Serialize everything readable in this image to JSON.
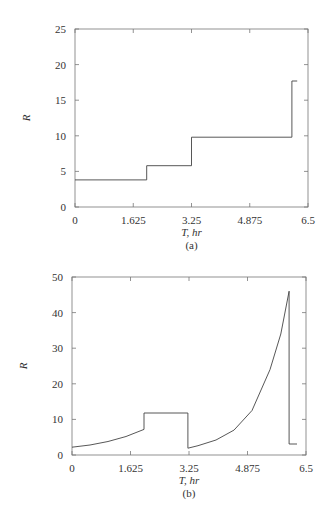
{
  "chart_data": [
    {
      "type": "line",
      "caption": "(a)",
      "xlabel": "T, hr",
      "ylabel": "R",
      "xlim": [
        0,
        6.5
      ],
      "ylim": [
        0,
        25
      ],
      "xticks": [
        "0",
        "1.625",
        "3.25",
        "4.875",
        "6.5"
      ],
      "yticks": [
        "0",
        "5",
        "10",
        "15",
        "20",
        "25"
      ],
      "grid": false,
      "series": [
        {
          "name": "R (step)",
          "x": [
            0,
            2.0,
            2.0,
            3.25,
            3.25,
            6.05,
            6.05,
            6.2
          ],
          "y": [
            3.8,
            3.8,
            5.8,
            5.8,
            9.8,
            9.8,
            17.7,
            17.7
          ]
        }
      ]
    },
    {
      "type": "line",
      "caption": "(b)",
      "xlabel": "T, hr",
      "ylabel": "R",
      "xlim": [
        0,
        6.5
      ],
      "ylim": [
        0,
        50
      ],
      "xticks": [
        "0",
        "1.625",
        "3.25",
        "4.875",
        "6.5"
      ],
      "yticks": [
        "0",
        "10",
        "20",
        "30",
        "40",
        "50"
      ],
      "grid": false,
      "series": [
        {
          "name": "R",
          "x": [
            0,
            0.5,
            1.0,
            1.5,
            2.0,
            2.0,
            3.22,
            3.22,
            3.5,
            4.0,
            4.5,
            5.0,
            5.5,
            5.8,
            6.03,
            6.03,
            6.25
          ],
          "y": [
            2.2,
            2.8,
            3.8,
            5.2,
            7.2,
            11.8,
            11.8,
            1.9,
            2.6,
            4.2,
            7.0,
            12.5,
            24,
            34,
            46,
            3.1,
            3.1
          ]
        }
      ]
    }
  ]
}
